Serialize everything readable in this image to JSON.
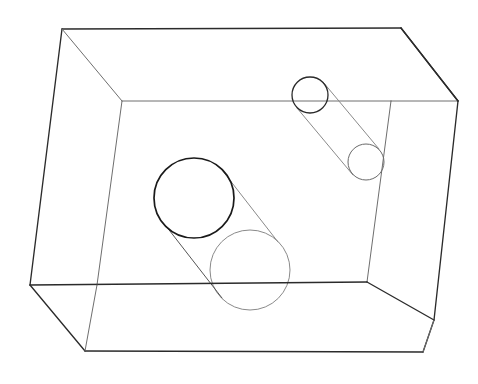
{
  "figure": {
    "background_color": "#ffffff",
    "width": 478,
    "height": 384
  },
  "colors": {
    "near_edge": "#2b2b2b",
    "far_edge": "#6e6e6e",
    "cylinder_front_rim": "#1a1a1a",
    "cylinder_back_rim": "#8a8a8a",
    "small_cylinder_back_rim": "#2b2b2b",
    "small_cylinder_front_rim": "#6a6a6a"
  },
  "box": {
    "name": "wireframe-box",
    "stroke_color": "#2b2b2b",
    "front_face": {
      "name": "front-face",
      "points": "62,29 401,28 423,352 85,351",
      "corners": [
        {
          "label": "front-top-left",
          "x": 62,
          "y": 29
        },
        {
          "label": "front-top-right",
          "x": 401,
          "y": 28
        },
        {
          "label": "front-bottom-right",
          "x": 423,
          "y": 352
        },
        {
          "label": "front-bottom-left",
          "x": 85,
          "y": 351
        }
      ]
    },
    "back_face": {
      "name": "back-face",
      "points": "122,101 391,101 367,282 97,285",
      "corners": [
        {
          "label": "back-top-left",
          "x": 122,
          "y": 101
        },
        {
          "label": "back-top-right",
          "x": 391,
          "y": 101
        },
        {
          "label": "back-bottom-right",
          "x": 367,
          "y": 282
        },
        {
          "label": "back-bottom-left",
          "x": 97,
          "y": 285
        }
      ]
    },
    "left_face": {
      "name": "left-face",
      "points": "62,29 122,101 97,285 30,285",
      "outer_edge": "62,29 30,285"
    },
    "right_face": {
      "name": "right-face",
      "points": "401,28 458,101 434,320 423,352"
    },
    "bottom_outer": {
      "name": "bottom-outer-edge",
      "points": "30,285 85,351 423,352"
    },
    "connectors": [
      {
        "label": "connector-top-left",
        "x1": 62,
        "y1": 29,
        "x2": 122,
        "y2": 101
      },
      {
        "label": "connector-top-right",
        "x1": 401,
        "y1": 28,
        "x2": 458,
        "y2": 101
      },
      {
        "label": "connector-bottom-left",
        "x1": 85,
        "y1": 351,
        "x2": 97,
        "y2": 285
      },
      {
        "label": "connector-bottom-right",
        "x1": 423,
        "y1": 352,
        "x2": 434,
        "y2": 320
      }
    ],
    "edges": {
      "top_front": {
        "x1": 62,
        "y1": 29,
        "x2": 401,
        "y2": 28
      },
      "left_outer": {
        "x1": 62,
        "y1": 29,
        "x2": 30,
        "y2": 285
      },
      "left_lower": {
        "x1": 30,
        "y1": 285,
        "x2": 85,
        "y2": 351
      },
      "bottom_front": {
        "x1": 85,
        "y1": 351,
        "x2": 423,
        "y2": 352
      },
      "right_outer_upper": {
        "x1": 401,
        "y1": 28,
        "x2": 458,
        "y2": 101
      },
      "right_outer_lower": {
        "x1": 458,
        "y1": 101,
        "x2": 434,
        "y2": 320
      },
      "right_to_bottom": {
        "x1": 434,
        "y1": 320,
        "x2": 423,
        "y2": 352
      },
      "back_top": {
        "x1": 122,
        "y1": 101,
        "x2": 391,
        "y2": 101
      },
      "back_top_to_right": {
        "x1": 391,
        "y1": 101,
        "x2": 458,
        "y2": 101
      },
      "back_left_vertical": {
        "x1": 122,
        "y1": 101,
        "x2": 97,
        "y2": 285
      },
      "back_right_vertical": {
        "x1": 391,
        "y1": 101,
        "x2": 367,
        "y2": 282
      },
      "back_bottom": {
        "x1": 30,
        "y1": 285,
        "x2": 367,
        "y2": 282
      },
      "back_bottom_to_right": {
        "x1": 367,
        "y1": 282,
        "x2": 434,
        "y2": 320
      }
    }
  },
  "cylinders": [
    {
      "name": "large-cylinder",
      "position": "center-left, resting on floor of the box",
      "front_ellipse": {
        "cx": 194,
        "cy": 198,
        "r": 40,
        "stroke": "#1a1a1a",
        "emphasis": "bold"
      },
      "back_ellipse": {
        "cx": 250,
        "cy": 270,
        "r": 40,
        "stroke": "#8a8a8a",
        "emphasis": "light"
      },
      "side_line_upper": {
        "x1": 222,
        "y1": 170,
        "x2": 278,
        "y2": 242
      },
      "side_line_lower": {
        "x1": 166,
        "y1": 226,
        "x2": 222,
        "y2": 298
      },
      "axis_direction": "down-right (into the box)",
      "radius_px": 40
    },
    {
      "name": "small-cylinder",
      "position": "upper-right, suspended near the back-top edge",
      "front_ellipse": {
        "cx": 366,
        "cy": 162,
        "r": 18,
        "stroke": "#6a6a6a",
        "emphasis": "light"
      },
      "back_ellipse": {
        "cx": 310,
        "cy": 95,
        "r": 18,
        "stroke": "#2b2b2b",
        "emphasis": "bold"
      },
      "side_line_upper": {
        "x1": 323,
        "y1": 82,
        "x2": 379,
        "y2": 149
      },
      "side_line_lower": {
        "x1": 297,
        "y1": 108,
        "x2": 353,
        "y2": 175
      },
      "axis_direction": "down-right (toward the viewer)",
      "radius_px": 18
    }
  ],
  "labels": {
    "visible_text": []
  }
}
